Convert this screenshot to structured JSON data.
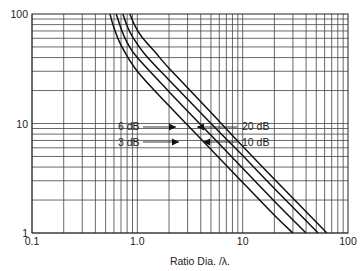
{
  "chart_data": {
    "type": "line",
    "title": "",
    "xlabel": "Ratio Dia. /λ.",
    "ylabel": "",
    "xscale": "log",
    "yscale": "log",
    "xlim": [
      0.1,
      100
    ],
    "ylim": [
      1,
      100
    ],
    "grid": true,
    "x_tick_labels": [
      "0.1",
      "1.0",
      "10",
      "100"
    ],
    "x_ticks": [
      0.1,
      1,
      10,
      100
    ],
    "y_tick_labels": [
      "1",
      "10",
      "100"
    ],
    "y_ticks": [
      1,
      10,
      100
    ],
    "series": [
      {
        "name": "3 dB",
        "x": [
          0.55,
          0.6,
          0.7,
          1.0,
          2.0,
          5.0,
          10,
          20,
          30
        ],
        "y": [
          100,
          75,
          52,
          30,
          14.5,
          5.8,
          2.9,
          1.45,
          1.0
        ]
      },
      {
        "name": "6 dB",
        "x": [
          0.63,
          0.7,
          0.8,
          1.0,
          2.0,
          5.0,
          10,
          20,
          40
        ],
        "y": [
          100,
          74,
          55,
          40,
          19.5,
          7.8,
          3.9,
          1.95,
          1.0
        ]
      },
      {
        "name": "10 dB",
        "x": [
          0.73,
          0.8,
          0.9,
          1.2,
          2.0,
          5.0,
          10,
          20,
          52
        ],
        "y": [
          100,
          78,
          62,
          42,
          25,
          10,
          5.1,
          2.55,
          1.0
        ]
      },
      {
        "name": "20 dB",
        "x": [
          0.85,
          0.95,
          1.1,
          1.5,
          2.0,
          5.0,
          10,
          20,
          63
        ],
        "y": [
          100,
          78,
          62,
          44,
          32,
          12.6,
          6.2,
          3.1,
          1.0
        ]
      }
    ],
    "annotations": [
      {
        "text": "6 dB",
        "side": "left",
        "points_to": "6 dB"
      },
      {
        "text": "3 dB",
        "side": "left",
        "points_to": "3 dB"
      },
      {
        "text": "20 dB",
        "side": "right",
        "points_to": "20 dB"
      },
      {
        "text": "10 dB",
        "side": "right",
        "points_to": "10 dB"
      }
    ]
  }
}
